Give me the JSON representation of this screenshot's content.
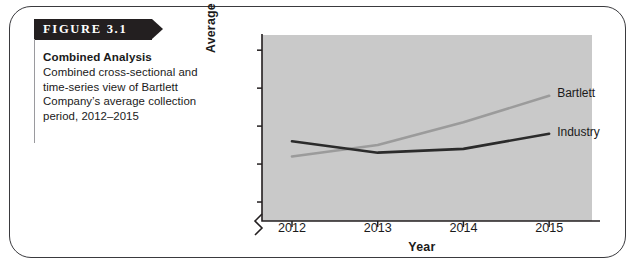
{
  "figure": {
    "tag_label": "FIGURE 3.1",
    "caption_title": "Combined Analysis",
    "caption_text": "Combined cross-sectional and time-series view of Bartlett Company’s average collection period, 2012–2015"
  },
  "colors": {
    "plot_background": "#c9c9c9",
    "card_border": "#3a3a3e",
    "tag_background": "#231f20",
    "bartlett_line": "#9b9b9b",
    "industry_line": "#2b2b2b",
    "axis": "#231f20"
  },
  "chart_data": {
    "type": "line",
    "title": "",
    "xlabel": "Year",
    "ylabel": "Average Collection Period (days)",
    "categories": [
      "2012",
      "2013",
      "2014",
      "2015"
    ],
    "x": [
      2012,
      2013,
      2014,
      2015
    ],
    "yticks": [
      30,
      40,
      50,
      60,
      70
    ],
    "ylim": [
      25,
      74
    ],
    "xlim": [
      2011.65,
      2015.5
    ],
    "axis_break": true,
    "grid": false,
    "legend_position": "inline-right",
    "series": [
      {
        "name": "Bartlett",
        "color": "#9b9b9b",
        "values": [
          42,
          45,
          51,
          58
        ],
        "label": "Bartlett"
      },
      {
        "name": "Industry",
        "color": "#2b2b2b",
        "values": [
          46,
          43,
          44,
          48
        ],
        "label": "Industry"
      }
    ]
  }
}
